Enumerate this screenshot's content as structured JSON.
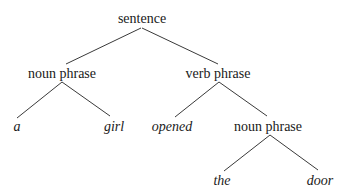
{
  "diagram": {
    "type": "parse-tree",
    "nodes": {
      "root": {
        "label": "sentence",
        "x": 142,
        "y": 11
      },
      "np1": {
        "label": "noun phrase",
        "x": 62,
        "y": 66
      },
      "vp": {
        "label": "verb phrase",
        "x": 218,
        "y": 66
      },
      "a": {
        "label": "a",
        "x": 17,
        "y": 119
      },
      "girl": {
        "label": "girl",
        "x": 114,
        "y": 119
      },
      "opened": {
        "label": "opened",
        "x": 172,
        "y": 119
      },
      "np2": {
        "label": "noun phrase",
        "x": 267,
        "y": 119
      },
      "the": {
        "label": "the",
        "x": 222,
        "y": 173
      },
      "door": {
        "label": "door",
        "x": 320,
        "y": 173
      }
    },
    "edges": [
      {
        "from": "root",
        "to": "np1"
      },
      {
        "from": "root",
        "to": "vp"
      },
      {
        "from": "np1",
        "to": "a"
      },
      {
        "from": "np1",
        "to": "girl"
      },
      {
        "from": "vp",
        "to": "opened"
      },
      {
        "from": "vp",
        "to": "np2"
      },
      {
        "from": "np2",
        "to": "the"
      },
      {
        "from": "np2",
        "to": "door"
      }
    ]
  }
}
